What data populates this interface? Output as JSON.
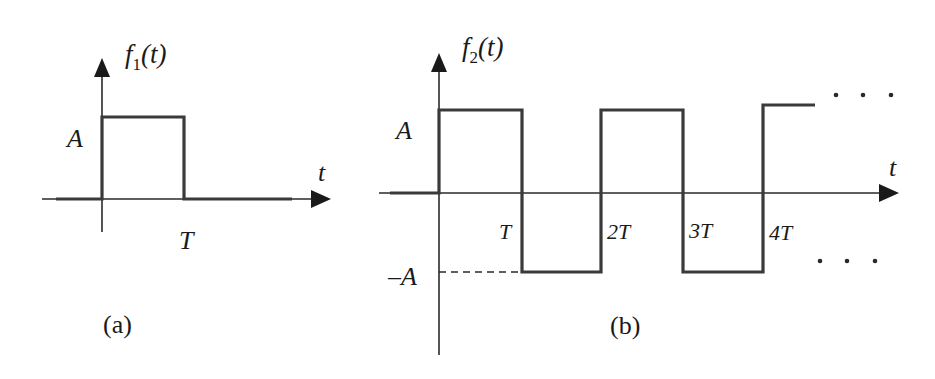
{
  "figure_a": {
    "function_label": "f",
    "function_subscript": "1",
    "function_arg": "(t)",
    "amplitude_label": "A",
    "time_axis_label": "t",
    "period_label": "T",
    "caption": "(a)"
  },
  "figure_b": {
    "function_label": "f",
    "function_subscript": "2",
    "function_arg": "(t)",
    "amplitude_label": "A",
    "neg_amplitude_label": "–A",
    "time_axis_label": "t",
    "tick_labels": [
      "T",
      "2T",
      "3T",
      "4T"
    ],
    "continuation": "·  ·  ·",
    "caption": "(b)"
  },
  "colors": {
    "stroke": "#2a2a2a",
    "background": "#ffffff"
  }
}
